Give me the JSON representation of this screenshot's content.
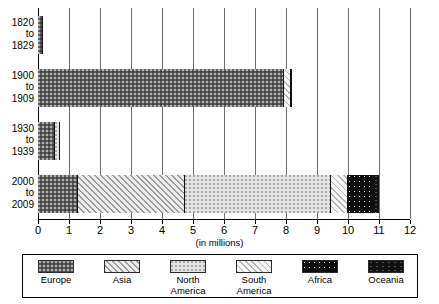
{
  "chart_data": {
    "type": "bar",
    "orientation": "horizontal",
    "stacked": true,
    "title": "",
    "xlabel": "(in millions)",
    "ylabel": "",
    "xlim": [
      0,
      12
    ],
    "xticks": [
      0,
      1,
      2,
      3,
      4,
      5,
      6,
      7,
      8,
      9,
      10,
      11,
      12
    ],
    "grid": "vertical",
    "legend_position": "bottom",
    "categories": [
      "1820 to 1829",
      "1900 to 1909",
      "1930 to 1939",
      "2000 to 2009"
    ],
    "category_lines": [
      [
        "1820",
        "to",
        "1829"
      ],
      [
        "1900",
        "to",
        "1909"
      ],
      [
        "1930",
        "to",
        "1939"
      ],
      [
        "2000",
        "to",
        "2009"
      ]
    ],
    "series": [
      {
        "name": "Europe",
        "pattern": "dark-gray-dotted",
        "color": "#5e5e5e",
        "values": [
          0.15,
          7.95,
          0.55,
          1.3
        ]
      },
      {
        "name": "Asia",
        "pattern": "gray-diagonal-hatch",
        "color": "#9a9a9a",
        "values": [
          0.0,
          0.0,
          0.0,
          3.45
        ]
      },
      {
        "name": "North America",
        "pattern": "light-dotted",
        "color": "#c8c8c8",
        "values": [
          0.0,
          0.0,
          0.17,
          4.7
        ]
      },
      {
        "name": "South America",
        "pattern": "light-diagonal-hatch",
        "color": "#b4b4b4",
        "values": [
          0.0,
          0.2,
          0.0,
          0.55
        ]
      },
      {
        "name": "Africa",
        "pattern": "black-white-dotted",
        "color": "#0d0d0d",
        "values": [
          0.0,
          0.0,
          0.0,
          0.85
        ]
      },
      {
        "name": "Oceania",
        "pattern": "solid-black",
        "color": "#111111",
        "values": [
          0.0,
          0.05,
          0.0,
          0.15
        ]
      }
    ],
    "totals": [
      0.15,
      8.2,
      0.72,
      11.0
    ]
  },
  "axis": {
    "x_title": "(in millions)",
    "tick_labels": [
      "0",
      "1",
      "2",
      "3",
      "4",
      "5",
      "6",
      "7",
      "8",
      "9",
      "10",
      "11",
      "12"
    ]
  },
  "legend": {
    "items": [
      {
        "label_line1": "Europe",
        "label_line2": ""
      },
      {
        "label_line1": "Asia",
        "label_line2": ""
      },
      {
        "label_line1": "North",
        "label_line2": "America"
      },
      {
        "label_line1": "South",
        "label_line2": "America"
      },
      {
        "label_line1": "Africa",
        "label_line2": ""
      },
      {
        "label_line1": "Oceania",
        "label_line2": ""
      }
    ]
  }
}
